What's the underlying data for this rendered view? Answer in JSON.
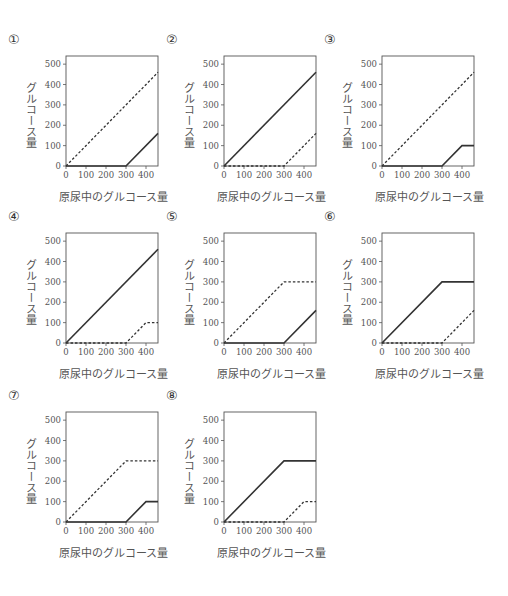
{
  "chart_data": [
    {
      "id": "1",
      "label": "①",
      "type": "line",
      "xlabel": "原尿中のグルコース量",
      "ylabel": "グルコース量",
      "xticks": [
        0,
        100,
        200,
        300,
        400
      ],
      "yticks": [
        0,
        100,
        200,
        300,
        400,
        500
      ],
      "xlim": [
        0,
        460
      ],
      "ylim": [
        0,
        540
      ],
      "series": [
        {
          "name": "dashed",
          "style": "dashed",
          "points": [
            [
              0,
              0
            ],
            [
              460,
              460
            ]
          ]
        },
        {
          "name": "solid",
          "style": "solid",
          "points": [
            [
              0,
              0
            ],
            [
              300,
              0
            ],
            [
              460,
              160
            ]
          ]
        }
      ]
    },
    {
      "id": "2",
      "label": "②",
      "type": "line",
      "xlabel": "原尿中のグルコース量",
      "ylabel": "グルコース量",
      "xticks": [
        0,
        100,
        200,
        300,
        400
      ],
      "yticks": [
        0,
        100,
        200,
        300,
        400,
        500
      ],
      "xlim": [
        0,
        460
      ],
      "ylim": [
        0,
        540
      ],
      "series": [
        {
          "name": "solid",
          "style": "solid",
          "points": [
            [
              0,
              0
            ],
            [
              460,
              460
            ]
          ]
        },
        {
          "name": "dashed",
          "style": "dashed",
          "points": [
            [
              0,
              0
            ],
            [
              300,
              0
            ],
            [
              460,
              160
            ]
          ]
        }
      ]
    },
    {
      "id": "3",
      "label": "③",
      "type": "line",
      "xlabel": "原尿中のグルコース量",
      "ylabel": "グルコース量",
      "xticks": [
        0,
        100,
        200,
        300,
        400
      ],
      "yticks": [
        0,
        100,
        200,
        300,
        400,
        500
      ],
      "xlim": [
        0,
        460
      ],
      "ylim": [
        0,
        540
      ],
      "series": [
        {
          "name": "dashed",
          "style": "dashed",
          "points": [
            [
              0,
              0
            ],
            [
              460,
              460
            ]
          ]
        },
        {
          "name": "solid",
          "style": "solid",
          "points": [
            [
              0,
              0
            ],
            [
              300,
              0
            ],
            [
              400,
              100
            ],
            [
              460,
              100
            ]
          ]
        }
      ]
    },
    {
      "id": "4",
      "label": "④",
      "type": "line",
      "xlabel": "原尿中のグルコース量",
      "ylabel": "グルコース量",
      "xticks": [
        0,
        100,
        200,
        300,
        400
      ],
      "yticks": [
        0,
        100,
        200,
        300,
        400,
        500
      ],
      "xlim": [
        0,
        460
      ],
      "ylim": [
        0,
        540
      ],
      "series": [
        {
          "name": "solid",
          "style": "solid",
          "points": [
            [
              0,
              0
            ],
            [
              460,
              460
            ]
          ]
        },
        {
          "name": "dashed",
          "style": "dashed",
          "points": [
            [
              0,
              0
            ],
            [
              300,
              0
            ],
            [
              400,
              100
            ],
            [
              460,
              100
            ]
          ]
        }
      ]
    },
    {
      "id": "5",
      "label": "⑤",
      "type": "line",
      "xlabel": "原尿中のグルコース量",
      "ylabel": "グルコース量",
      "xticks": [
        0,
        100,
        200,
        300,
        400
      ],
      "yticks": [
        0,
        100,
        200,
        300,
        400,
        500
      ],
      "xlim": [
        0,
        460
      ],
      "ylim": [
        0,
        540
      ],
      "series": [
        {
          "name": "dashed",
          "style": "dashed",
          "points": [
            [
              0,
              0
            ],
            [
              300,
              300
            ],
            [
              460,
              300
            ]
          ]
        },
        {
          "name": "solid",
          "style": "solid",
          "points": [
            [
              0,
              0
            ],
            [
              300,
              0
            ],
            [
              460,
              160
            ]
          ]
        }
      ]
    },
    {
      "id": "6",
      "label": "⑥",
      "type": "line",
      "xlabel": "原尿中のグルコース量",
      "ylabel": "グルコース量",
      "xticks": [
        0,
        100,
        200,
        300,
        400
      ],
      "yticks": [
        0,
        100,
        200,
        300,
        400,
        500
      ],
      "xlim": [
        0,
        460
      ],
      "ylim": [
        0,
        540
      ],
      "series": [
        {
          "name": "solid",
          "style": "solid",
          "points": [
            [
              0,
              0
            ],
            [
              300,
              300
            ],
            [
              460,
              300
            ]
          ]
        },
        {
          "name": "dashed",
          "style": "dashed",
          "points": [
            [
              0,
              0
            ],
            [
              300,
              0
            ],
            [
              460,
              160
            ]
          ]
        }
      ]
    },
    {
      "id": "7",
      "label": "⑦",
      "type": "line",
      "xlabel": "原尿中のグルコース量",
      "ylabel": "グルコース量",
      "xticks": [
        0,
        100,
        200,
        300,
        400
      ],
      "yticks": [
        0,
        100,
        200,
        300,
        400,
        500
      ],
      "xlim": [
        0,
        460
      ],
      "ylim": [
        0,
        540
      ],
      "series": [
        {
          "name": "dashed",
          "style": "dashed",
          "points": [
            [
              0,
              0
            ],
            [
              300,
              300
            ],
            [
              460,
              300
            ]
          ]
        },
        {
          "name": "solid",
          "style": "solid",
          "points": [
            [
              0,
              0
            ],
            [
              300,
              0
            ],
            [
              400,
              100
            ],
            [
              460,
              100
            ]
          ]
        }
      ]
    },
    {
      "id": "8",
      "label": "⑧",
      "type": "line",
      "xlabel": "原尿中のグルコース量",
      "ylabel": "グルコース量",
      "xticks": [
        0,
        100,
        200,
        300,
        400
      ],
      "yticks": [
        0,
        100,
        200,
        300,
        400,
        500
      ],
      "xlim": [
        0,
        460
      ],
      "ylim": [
        0,
        540
      ],
      "series": [
        {
          "name": "solid",
          "style": "solid",
          "points": [
            [
              0,
              0
            ],
            [
              300,
              300
            ],
            [
              460,
              300
            ]
          ]
        },
        {
          "name": "dashed",
          "style": "dashed",
          "points": [
            [
              0,
              0
            ],
            [
              300,
              0
            ],
            [
              400,
              100
            ],
            [
              460,
              100
            ]
          ]
        }
      ]
    }
  ],
  "colors": {
    "line": "#333333",
    "frame": "#555555",
    "text": "#555555"
  }
}
